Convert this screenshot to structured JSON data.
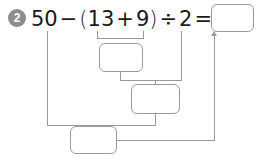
{
  "problem": {
    "number": "2",
    "badge_color": "#8c8c8c",
    "expression_tokens": [
      "50",
      "−",
      "(",
      "13",
      "+",
      "9",
      ")",
      "÷",
      "2",
      "="
    ],
    "expression_text": "50 − (13 + 9) ÷ 2 ="
  },
  "boxes": {
    "answer": {
      "label": "",
      "value": "",
      "placeholder": ""
    },
    "sum": {
      "label": "",
      "value": "",
      "placeholder": ""
    },
    "quotient": {
      "label": "",
      "value": "",
      "placeholder": ""
    },
    "result": {
      "label": "",
      "value": "",
      "placeholder": ""
    }
  },
  "colors": {
    "line": "#9a9a9a",
    "box_border": "#9a9a9a",
    "text": "#1a1a1a",
    "background": "#ffffff"
  }
}
